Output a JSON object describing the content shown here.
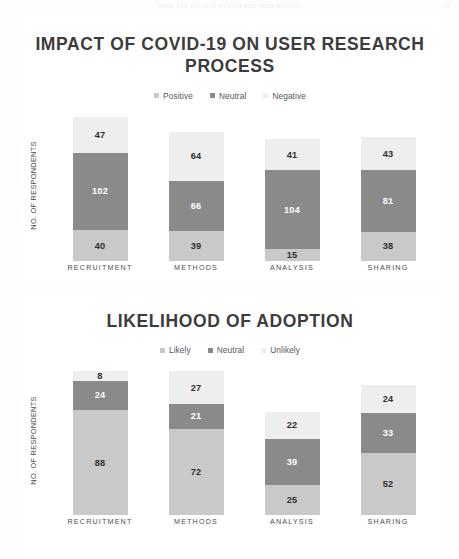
{
  "page_header": {
    "text": "IMPACT OF COVID-19 ON USER RESEARCH PROCESS",
    "page_number": "10"
  },
  "colors": {
    "positive": "#c9c9c9",
    "neutral": "#8a8a8a",
    "negative": "#eeeeee",
    "likely": "#c9c9c9",
    "unlikely": "#eeeeee",
    "title_text": "#3c3c3c",
    "panel_bg": "#ffffff",
    "page_bg": "#fdfdfd"
  },
  "charts": [
    {
      "title": "IMPACT OF COVID-19 ON USER RESEARCH PROCESS",
      "y_axis_label": "NO. OF RESPONDENTS",
      "legend": [
        {
          "label": "Positive",
          "color": "#c9c9c9"
        },
        {
          "label": "Neutral",
          "color": "#8a8a8a"
        },
        {
          "label": "Negative",
          "color": "#eeeeee"
        }
      ],
      "categories": [
        "RECRUITMENT",
        "METHODS",
        "ANALYSIS",
        "SHARING"
      ],
      "columns": [
        {
          "category": "RECRUITMENT",
          "segments": [
            {
              "series": "Negative",
              "value": 47,
              "color": "#eeeeee",
              "text_color": "#2f2f2f"
            },
            {
              "series": "Neutral",
              "value": 102,
              "color": "#8a8a8a",
              "text_color": "#ffffff"
            },
            {
              "series": "Positive",
              "value": 40,
              "color": "#c9c9c9",
              "text_color": "#2f2f2f"
            }
          ]
        },
        {
          "category": "METHODS",
          "segments": [
            {
              "series": "Negative",
              "value": 64,
              "color": "#eeeeee",
              "text_color": "#2f2f2f"
            },
            {
              "series": "Neutral",
              "value": 66,
              "color": "#8a8a8a",
              "text_color": "#ffffff"
            },
            {
              "series": "Positive",
              "value": 39,
              "color": "#c9c9c9",
              "text_color": "#2f2f2f"
            }
          ]
        },
        {
          "category": "ANALYSIS",
          "segments": [
            {
              "series": "Negative",
              "value": 41,
              "color": "#eeeeee",
              "text_color": "#2f2f2f"
            },
            {
              "series": "Neutral",
              "value": 104,
              "color": "#8a8a8a",
              "text_color": "#ffffff"
            },
            {
              "series": "Positive",
              "value": 15,
              "color": "#c9c9c9",
              "text_color": "#2f2f2f"
            }
          ]
        },
        {
          "category": "SHARING",
          "segments": [
            {
              "series": "Negative",
              "value": 43,
              "color": "#eeeeee",
              "text_color": "#2f2f2f"
            },
            {
              "series": "Neutral",
              "value": 81,
              "color": "#8a8a8a",
              "text_color": "#ffffff"
            },
            {
              "series": "Positive",
              "value": 38,
              "color": "#c9c9c9",
              "text_color": "#2f2f2f"
            }
          ]
        }
      ]
    },
    {
      "title": "LIKELIHOOD OF ADOPTION",
      "y_axis_label": "NO. OF RESPONDENTS",
      "legend": [
        {
          "label": "Likely",
          "color": "#c9c9c9"
        },
        {
          "label": "Neutral",
          "color": "#8a8a8a"
        },
        {
          "label": "Unlikely",
          "color": "#eeeeee"
        }
      ],
      "categories": [
        "RECRUITMENT",
        "METHODS",
        "ANALYSIS",
        "SHARING"
      ],
      "columns": [
        {
          "category": "RECRUITMENT",
          "segments": [
            {
              "series": "Unlikely",
              "value": 8,
              "color": "#eeeeee",
              "text_color": "#2f2f2f"
            },
            {
              "series": "Neutral",
              "value": 24,
              "color": "#8a8a8a",
              "text_color": "#ffffff"
            },
            {
              "series": "Likely",
              "value": 88,
              "color": "#c9c9c9",
              "text_color": "#2f2f2f"
            }
          ]
        },
        {
          "category": "METHODS",
          "segments": [
            {
              "series": "Unlikely",
              "value": 27,
              "color": "#eeeeee",
              "text_color": "#2f2f2f"
            },
            {
              "series": "Neutral",
              "value": 21,
              "color": "#8a8a8a",
              "text_color": "#ffffff"
            },
            {
              "series": "Likely",
              "value": 72,
              "color": "#c9c9c9",
              "text_color": "#2f2f2f"
            }
          ]
        },
        {
          "category": "ANALYSIS",
          "segments": [
            {
              "series": "Unlikely",
              "value": 22,
              "color": "#eeeeee",
              "text_color": "#2f2f2f"
            },
            {
              "series": "Neutral",
              "value": 39,
              "color": "#8a8a8a",
              "text_color": "#ffffff"
            },
            {
              "series": "Likely",
              "value": 25,
              "color": "#c9c9c9",
              "text_color": "#2f2f2f"
            }
          ]
        },
        {
          "category": "SHARING",
          "segments": [
            {
              "series": "Unlikely",
              "value": 24,
              "color": "#eeeeee",
              "text_color": "#2f2f2f"
            },
            {
              "series": "Neutral",
              "value": 33,
              "color": "#8a8a8a",
              "text_color": "#ffffff"
            },
            {
              "series": "Likely",
              "value": 52,
              "color": "#c9c9c9",
              "text_color": "#2f2f2f"
            }
          ]
        }
      ]
    }
  ],
  "chart_data": [
    {
      "type": "bar",
      "stacked": true,
      "title": "IMPACT OF COVID-19 ON USER RESEARCH PROCESS",
      "xlabel": "",
      "ylabel": "NO. OF RESPONDENTS",
      "grid": false,
      "legend_position": "top-center",
      "categories": [
        "RECRUITMENT",
        "METHODS",
        "ANALYSIS",
        "SHARING"
      ],
      "series": [
        {
          "name": "Positive",
          "values": [
            40,
            39,
            15,
            38
          ],
          "color": "#c9c9c9"
        },
        {
          "name": "Neutral",
          "values": [
            102,
            66,
            104,
            81
          ],
          "color": "#8a8a8a"
        },
        {
          "name": "Negative",
          "values": [
            47,
            64,
            41,
            43
          ],
          "color": "#eeeeee"
        }
      ],
      "totals": [
        189,
        169,
        160,
        162
      ],
      "ylim": [
        0,
        189
      ]
    },
    {
      "type": "bar",
      "stacked": true,
      "title": "LIKELIHOOD OF ADOPTION",
      "xlabel": "",
      "ylabel": "NO. OF RESPONDENTS",
      "grid": false,
      "legend_position": "top-center",
      "categories": [
        "RECRUITMENT",
        "METHODS",
        "ANALYSIS",
        "SHARING"
      ],
      "series": [
        {
          "name": "Likely",
          "values": [
            88,
            72,
            25,
            52
          ],
          "color": "#c9c9c9"
        },
        {
          "name": "Neutral",
          "values": [
            24,
            21,
            39,
            33
          ],
          "color": "#8a8a8a"
        },
        {
          "name": "Unlikely",
          "values": [
            8,
            27,
            22,
            24
          ],
          "color": "#eeeeee"
        }
      ],
      "totals": [
        120,
        120,
        86,
        109
      ],
      "ylim": [
        0,
        120
      ]
    }
  ]
}
